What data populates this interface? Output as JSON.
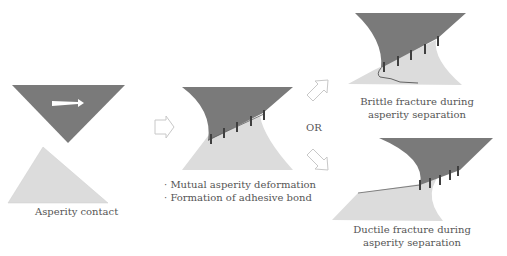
{
  "diagram": {
    "type": "process-flow",
    "title": "",
    "colors": {
      "upper_asperity": "#7a7a7a",
      "lower_asperity": "#dcdcdc",
      "bond_marks": "#4a4a4a",
      "arrow_outline": "#c8c8c8",
      "text": "#555555",
      "slip_arrow": "#ffffff"
    },
    "stages": [
      {
        "id": "asperity-contact",
        "caption": "Asperity contact"
      },
      {
        "id": "deformation",
        "bullets": [
          "Mutual asperity deformation",
          "Formation of adhesive bond"
        ]
      },
      {
        "id": "brittle",
        "caption_line1": "Brittle fracture during",
        "caption_line2": "asperity separation"
      },
      {
        "id": "ductile",
        "caption_line1": "Ductile fracture during",
        "caption_line2": "asperity separation"
      }
    ],
    "connector_label": "OR",
    "bullet_char": "·"
  }
}
